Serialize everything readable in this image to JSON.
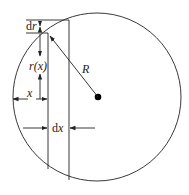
{
  "diagram": {
    "type": "geometry",
    "labels": {
      "dr_d": "d",
      "dr_var": "r",
      "rx": "r(x)",
      "R": "R",
      "x": "x",
      "dx_d": "d",
      "dx_var": "x"
    },
    "colors": {
      "stroke": "#222222",
      "background": "#ffffff"
    },
    "geometry": {
      "circle_center": [
        97,
        97
      ],
      "circle_radius": 84,
      "strip_left_x": 48,
      "strip_right_x": 69,
      "top_line_y": 20,
      "dr_line_y": 33
    }
  }
}
